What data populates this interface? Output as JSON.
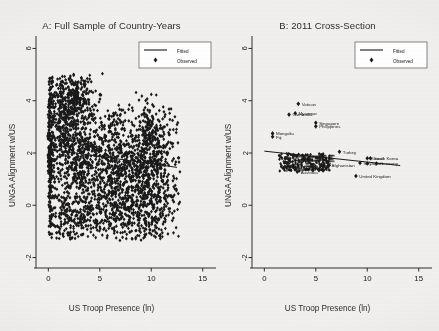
{
  "figure": {
    "background_color": "#f1f0ee",
    "ink_color": "#1a1a1a"
  },
  "chart_data": [
    {
      "type": "scatter",
      "panel": "A",
      "title": "A: Full Sample of Country-Years",
      "xlabel": "US Troop Presence (ln)",
      "ylabel": "UNGA Alignment w/US",
      "xlim": [
        -1.2,
        16
      ],
      "ylim": [
        -2.4,
        6.4
      ],
      "xticks": [
        0,
        5,
        10,
        15
      ],
      "yticks": [
        -2,
        0,
        2,
        4,
        6
      ],
      "xtick_labels": [
        "0",
        "5",
        "10",
        "15"
      ],
      "ytick_labels": [
        "-2",
        "0",
        "2",
        "4",
        "6"
      ],
      "grid": false,
      "legend_position": "top-right",
      "legend": [
        {
          "label": "Fitted",
          "marker": "line"
        },
        {
          "label": "Observed",
          "marker": "diamond"
        }
      ],
      "marker_shape": "diamond",
      "marker_color": "#111111",
      "fitted_line": {
        "x": [
          0.0,
          12.5
        ],
        "y": [
          2.15,
          1.45
        ]
      },
      "point_count_approx": 2400,
      "density_note": "Very dense black cloud; x from 0 to ~12.5, y from ~-1.3 to ~5.0; heaviest mass between y=0.5 and y=2.5 across all x, with an upper lobe near x=1-4, y=3.5-5.0.",
      "density_clusters": [
        {
          "cx": 0.2,
          "cy": 2.2,
          "sx": 0.22,
          "sy": 1.6,
          "n": 210
        },
        {
          "cx": 2.4,
          "cy": 4.1,
          "sx": 1.0,
          "sy": 0.52,
          "n": 330
        },
        {
          "cx": 1.6,
          "cy": 3.1,
          "sx": 0.9,
          "sy": 0.75,
          "n": 200
        },
        {
          "cx": 3.0,
          "cy": 1.9,
          "sx": 1.5,
          "sy": 0.85,
          "n": 420
        },
        {
          "cx": 6.2,
          "cy": 1.4,
          "sx": 2.0,
          "sy": 0.95,
          "n": 450
        },
        {
          "cx": 9.2,
          "cy": 1.3,
          "sx": 1.7,
          "sy": 1.0,
          "n": 400
        },
        {
          "cx": 10.6,
          "cy": 1.7,
          "sx": 1.1,
          "sy": 1.1,
          "n": 260
        },
        {
          "cx": 4.5,
          "cy": 0.1,
          "sx": 2.4,
          "sy": 0.6,
          "n": 230
        },
        {
          "cx": 8.6,
          "cy": -0.4,
          "sx": 2.2,
          "sy": 0.55,
          "n": 190
        },
        {
          "cx": 2.0,
          "cy": -0.5,
          "sx": 1.3,
          "sy": 0.5,
          "n": 120
        },
        {
          "cx": 9.6,
          "cy": 3.0,
          "sx": 0.55,
          "sy": 0.6,
          "n": 70
        },
        {
          "cx": 6.6,
          "cy": 3.2,
          "sx": 0.5,
          "sy": 0.35,
          "n": 40
        }
      ]
    },
    {
      "type": "scatter",
      "panel": "B",
      "title": "B: 2011 Cross-Section",
      "xlabel": "US Troop Presence (ln)",
      "ylabel": "UNGA Alignment w/US",
      "xlim": [
        -1.2,
        16
      ],
      "ylim": [
        -2.4,
        6.4
      ],
      "xticks": [
        0,
        5,
        10,
        15
      ],
      "yticks": [
        -2,
        0,
        2,
        4,
        6
      ],
      "xtick_labels": [
        "0",
        "5",
        "10",
        "15"
      ],
      "ytick_labels": [
        "-2",
        "0",
        "2",
        "4",
        "6"
      ],
      "grid": false,
      "legend_position": "top-right",
      "legend": [
        {
          "label": "Fitted",
          "marker": "line"
        },
        {
          "label": "Observed",
          "marker": "diamond"
        }
      ],
      "marker_shape": "diamond",
      "marker_color": "#111111",
      "fitted_line": {
        "x": [
          0.0,
          13.2
        ],
        "y": [
          2.07,
          1.52
        ]
      },
      "labeled_points": [
        {
          "label": "Vatican",
          "x": 3.3,
          "y": 3.88
        },
        {
          "label": "Cambodia",
          "x": 2.4,
          "y": 3.47
        },
        {
          "label": "Myanmar",
          "x": 3.0,
          "y": 3.52
        },
        {
          "label": "Singapore",
          "x": 5.0,
          "y": 3.16
        },
        {
          "label": "Philippines",
          "x": 5.0,
          "y": 3.02
        },
        {
          "label": "Mongolia",
          "x": 0.8,
          "y": 2.75
        },
        {
          "label": "Fiji",
          "x": 0.8,
          "y": 2.62
        },
        {
          "label": "Turkey",
          "x": 7.3,
          "y": 2.05
        },
        {
          "label": "South Korea",
          "x": 10.3,
          "y": 1.8
        },
        {
          "label": "Kuwait",
          "x": 10.0,
          "y": 1.8
        },
        {
          "label": "Italy",
          "x": 9.3,
          "y": 1.62
        },
        {
          "label": "Germany",
          "x": 10.9,
          "y": 1.6
        },
        {
          "label": "Japan",
          "x": 10.0,
          "y": 1.6
        },
        {
          "label": "Afghanistan",
          "x": 6.2,
          "y": 1.52
        },
        {
          "label": "Australia",
          "x": 3.2,
          "y": 1.28
        },
        {
          "label": "United Kingdom",
          "x": 8.9,
          "y": 1.12
        }
      ],
      "unlabeled_cluster": {
        "note": "Dense unlabeled cluster of ~150 countries near x=1.5-6, y=1.35-1.95",
        "x_range": [
          1.4,
          6.4
        ],
        "y_range": [
          1.3,
          1.98
        ],
        "n": 165
      }
    }
  ]
}
